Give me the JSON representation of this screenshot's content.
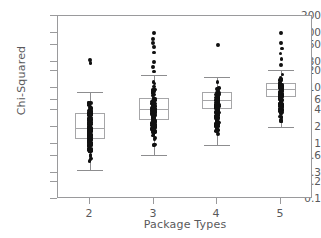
{
  "chart_data": {
    "type": "box",
    "title": "",
    "xlabel": "Package Types",
    "ylabel": "Chi-Squared",
    "yscale": "log",
    "ylim": [
      0.1,
      200
    ],
    "grid": false,
    "legend": null,
    "categories": [
      "2",
      "3",
      "4",
      "5"
    ],
    "ytick_labels": [
      "200",
      "100",
      "60",
      "30",
      "20",
      "10",
      "6",
      "4",
      "2",
      "1",
      "0.6",
      "0.3",
      "0.2",
      "0.1"
    ],
    "ytick_values": [
      200,
      100,
      60,
      30,
      20,
      10,
      6,
      4,
      2,
      1,
      0.6,
      0.3,
      0.2,
      0.1
    ],
    "xtick_labels": [
      "2",
      "3",
      "4",
      "5"
    ],
    "series": [
      {
        "name": "2",
        "category": "2",
        "whisker_low": 0.33,
        "q1": 1.2,
        "median": 1.9,
        "q3": 3.6,
        "whisker_high": 8.5,
        "outliers": [
          28,
          32
        ],
        "point_overlay": true
      },
      {
        "name": "3",
        "category": "3",
        "whisker_low": 0.62,
        "q1": 2.7,
        "median": 4.2,
        "q3": 6.6,
        "whisker_high": 17,
        "outliers": [
          20,
          24,
          30,
          44,
          55,
          66,
          78,
          100
        ],
        "point_overlay": true
      },
      {
        "name": "4",
        "category": "4",
        "whisker_low": 0.95,
        "q1": 4.2,
        "median": 6.0,
        "q3": 8.6,
        "whisker_high": 16,
        "outliers": [
          1.5,
          2.2,
          60
        ],
        "point_overlay": true
      },
      {
        "name": "5",
        "category": "5",
        "whisker_low": 2.0,
        "q1": 7.0,
        "median": 9.5,
        "q3": 12.5,
        "whisker_high": 21,
        "outliers": [
          3.0,
          3.6,
          26,
          34,
          42,
          52,
          66,
          100
        ],
        "point_overlay": true
      }
    ]
  },
  "axes": {
    "ylabel": "Chi-Squared",
    "xlabel": "Package Types"
  },
  "colors": {
    "point": "#111111",
    "box_outline": "#a6a6a8",
    "whisker": "#8d8d8f",
    "frame": "#9a9a9c",
    "text": "#59595b",
    "background": "#ffffff"
  }
}
